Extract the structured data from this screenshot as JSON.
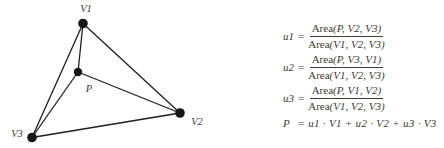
{
  "figure": {
    "background": "#ffffff",
    "ink": "#1f1e1c",
    "text_color": "#3e3b34"
  },
  "diagram": {
    "vertex_labels": {
      "v1": "V1",
      "v2": "V2",
      "v3": "V3",
      "p": "P"
    }
  },
  "equations": {
    "fractions": [
      {
        "lhs": "u1",
        "rel": "=",
        "num_fn": "Area",
        "num_args": "(P, V2, V3)",
        "den_fn": "Area",
        "den_args": "(V1, V2, V3)"
      },
      {
        "lhs": "u2",
        "rel": "=",
        "num_fn": "Area",
        "num_args": "(P, V3, V1)",
        "den_fn": "Area",
        "den_args": "(V1, V2, V3)"
      },
      {
        "lhs": "u3",
        "rel": "=",
        "num_fn": "Area",
        "num_args": "(P, V1, V2)",
        "den_fn": "Area",
        "den_args": "(V1, V2, V3)"
      }
    ],
    "result": {
      "lhs": "P",
      "rel": "=",
      "rhs": "u1 · V1 + u2 · V2 + u3 · V3"
    }
  }
}
